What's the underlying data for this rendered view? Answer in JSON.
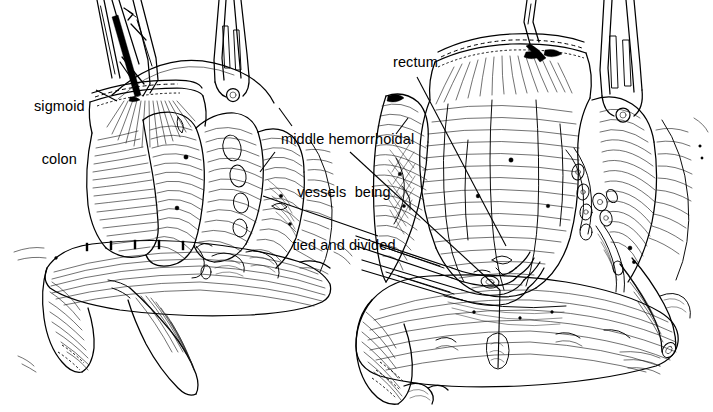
{
  "figure": {
    "kind": "surgical-illustration",
    "background_color": "#ffffff",
    "ink_color": "#000000",
    "panels": [
      {
        "id": "left",
        "name": "sigmoid-colon-mobilized",
        "caption": "Left panel: divided sigmoid colon held up by clamps above the pelvic brim"
      },
      {
        "id": "right",
        "name": "rectum-mobilized",
        "caption": "Right panel: rectum retracted with middle hemorrhoidal vessels clamped"
      }
    ]
  },
  "labels": {
    "sigmoid": {
      "line1": "sigmoid",
      "line2": "colon",
      "full": "sigmoid colon",
      "leader_from": [
        96,
        90
      ],
      "leader_to": [
        117,
        101
      ]
    },
    "middle_vessels": {
      "line1": "middle hemorrhoidal",
      "line2": "vessels  being",
      "line3": "tied and divided",
      "full": "middle hemorrhoidal vessels being tied and divided",
      "leader_from": [
        350,
        152
      ],
      "leader_to": [
        500,
        290
      ]
    },
    "rectum": {
      "text": "rectum",
      "leader_from": [
        417,
        77
      ],
      "leader_to": [
        506,
        246
      ]
    }
  },
  "instruments": [
    {
      "name": "kocher-clamp-left-upper",
      "panel": "left",
      "type": "clamp"
    },
    {
      "name": "kocher-clamp-left-second",
      "panel": "left",
      "type": "clamp"
    },
    {
      "name": "forceps-left-right-side",
      "panel": "left",
      "type": "forceps"
    },
    {
      "name": "forceps-right-upper",
      "panel": "right",
      "type": "forceps"
    },
    {
      "name": "hemostat-upper",
      "panel": "right",
      "type": "hemostat"
    },
    {
      "name": "hemostat-lower",
      "panel": "right",
      "type": "hemostat"
    }
  ],
  "anatomy": [
    {
      "name": "sigmoid-colon-stump",
      "panel": "left"
    },
    {
      "name": "pelvic-brim",
      "panel": "left"
    },
    {
      "name": "bladder",
      "panel": "left"
    },
    {
      "name": "rectum",
      "panel": "right"
    },
    {
      "name": "middle-hemorrhoidal-vessels",
      "panel": "right"
    },
    {
      "name": "ureter",
      "panel": "right"
    },
    {
      "name": "bladder",
      "panel": "right"
    },
    {
      "name": "pelvic-sidewall",
      "panel": "right"
    }
  ]
}
